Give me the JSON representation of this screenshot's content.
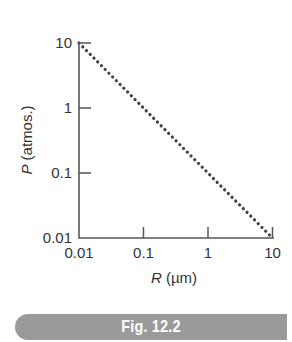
{
  "figure": {
    "caption": "Fig. 12.2",
    "banner_color": "#9a9a9a"
  },
  "chart_data": {
    "type": "line",
    "title": "",
    "xlabel_italic": "R",
    "xlabel_unit": " (µm)",
    "ylabel_italic": "P",
    "ylabel_unit": " (atmos.)",
    "x_scale": "log",
    "y_scale": "log",
    "xlim": [
      0.01,
      10
    ],
    "ylim": [
      0.01,
      10
    ],
    "x_ticks": [
      0.01,
      0.1,
      1,
      10
    ],
    "x_tick_labels": [
      "0.01",
      "0.1",
      "1",
      "10"
    ],
    "y_ticks": [
      0.01,
      0.1,
      1,
      10
    ],
    "y_tick_labels": [
      "0.01",
      "0.1",
      "1",
      "10"
    ],
    "grid": false,
    "series": [
      {
        "name": "P vs R",
        "style": "dotted",
        "color": "#444444",
        "x": [
          0.01,
          0.1,
          1,
          10
        ],
        "y": [
          10,
          1,
          0.1,
          0.01
        ]
      }
    ]
  }
}
